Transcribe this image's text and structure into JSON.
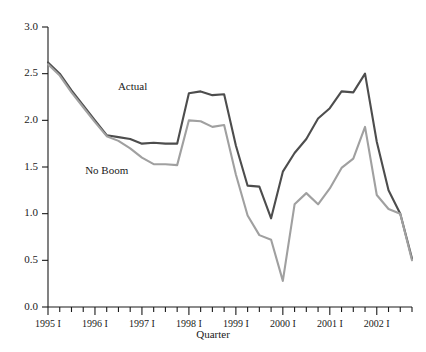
{
  "chart_data": {
    "type": "line",
    "title": "",
    "xlabel": "Quarter",
    "ylabel": "",
    "ylim": [
      0.0,
      3.0
    ],
    "ytick_values": [
      0.0,
      0.5,
      1.0,
      1.5,
      2.0,
      2.5,
      3.0
    ],
    "ytick_labels": [
      "0.0",
      "0.5",
      "1.0",
      "1.5",
      "2.0",
      "2.5",
      "3.0"
    ],
    "grid": false,
    "legend_position": "inline-annotation",
    "x_major_labels": [
      "1995 I",
      "1996 I",
      "1997 I",
      "1998 I",
      "1999 I",
      "2000 I",
      "2001 I",
      "2002 I"
    ],
    "x_major_indices": [
      0,
      4,
      8,
      12,
      16,
      20,
      24,
      28
    ],
    "x": [
      "1995 I",
      "1995 II",
      "1995 III",
      "1995 IV",
      "1996 I",
      "1996 II",
      "1996 III",
      "1996 IV",
      "1997 I",
      "1997 II",
      "1997 III",
      "1997 IV",
      "1998 I",
      "1998 II",
      "1998 III",
      "1998 IV",
      "1999 I",
      "1999 II",
      "1999 III",
      "1999 IV",
      "2000 I",
      "2000 II",
      "2000 III",
      "2000 IV",
      "2001 I",
      "2001 II",
      "2001 III",
      "2001 IV",
      "2002 I",
      "2002 II",
      "2002 III",
      "2002 IV"
    ],
    "series": [
      {
        "name": "Actual",
        "color": "#4d4d4d",
        "label_x_index": 7.2,
        "label_y_value": 2.33,
        "values": [
          2.62,
          2.5,
          2.32,
          2.16,
          2.0,
          1.84,
          1.82,
          1.8,
          1.75,
          1.76,
          1.75,
          1.75,
          2.29,
          2.31,
          2.27,
          2.28,
          1.73,
          1.3,
          1.29,
          0.95,
          1.45,
          1.65,
          1.8,
          2.02,
          2.13,
          2.31,
          2.3,
          2.5,
          1.77,
          1.25,
          1.0,
          0.52
        ]
      },
      {
        "name": "No Boom",
        "color": "#a0a0a0",
        "label_x_index": 5.0,
        "label_y_value": 1.42,
        "values": [
          2.6,
          2.48,
          2.3,
          2.14,
          1.98,
          1.83,
          1.78,
          1.7,
          1.6,
          1.53,
          1.53,
          1.52,
          2.0,
          1.99,
          1.93,
          1.95,
          1.42,
          0.98,
          0.77,
          0.72,
          0.28,
          1.1,
          1.22,
          1.1,
          1.27,
          1.49,
          1.59,
          1.93,
          1.2,
          1.05,
          1.0,
          0.5
        ]
      }
    ]
  }
}
